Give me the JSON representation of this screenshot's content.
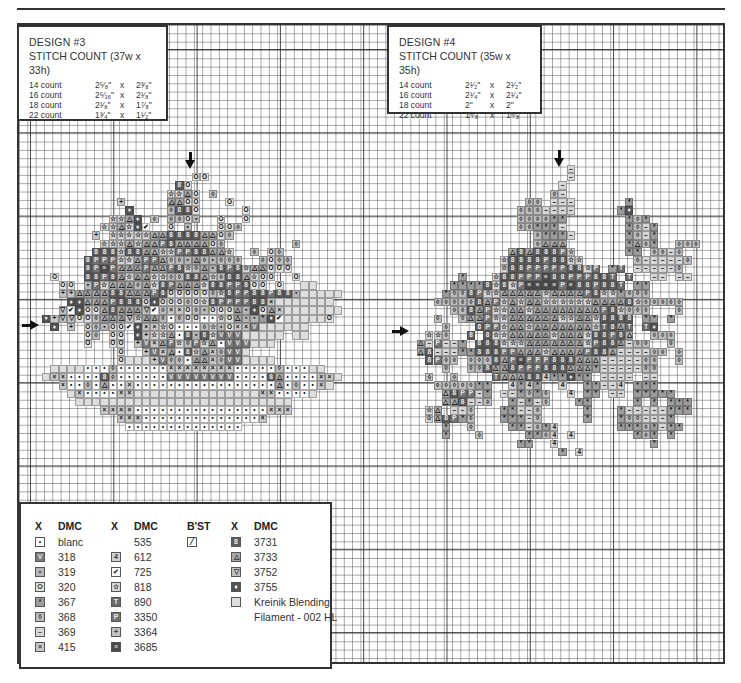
{
  "design3": {
    "title": "DESIGN #3",
    "stitch_count": "STITCH COUNT (37w x 33h)",
    "sizes": [
      {
        "count": "14 count",
        "w": "2⁵⁄₈\"",
        "x": "x",
        "h": "2³⁄₈\""
      },
      {
        "count": "16 count",
        "w": "2⁵⁄₁₆\"",
        "x": "x",
        "h": "2¹⁄₈\""
      },
      {
        "count": "18 count",
        "w": "2¹⁄₈\"",
        "x": "x",
        "h": "1⁷⁄₈\""
      },
      {
        "count": "22 count",
        "w": "1³⁄₄\"",
        "x": "x",
        "h": "1¹⁄₂\""
      }
    ]
  },
  "design4": {
    "title": "DESIGN #4",
    "stitch_count": "STITCH COUNT (35w x 35h)",
    "sizes": [
      {
        "count": "14 count",
        "w": "2¹⁄₂\"",
        "x": "x",
        "h": "2¹⁄₂\""
      },
      {
        "count": "16 count",
        "w": "2¹⁄₄\"",
        "x": "x",
        "h": "2¹⁄₄\""
      },
      {
        "count": "18 count",
        "w": "2\"",
        "x": "x",
        "h": "2\""
      },
      {
        "count": "22 count",
        "w": "1⁵⁄₈\"",
        "x": "x",
        "h": "1⁵⁄₈\""
      }
    ]
  },
  "legend": {
    "columns": [
      {
        "headers": {
          "x": "X",
          "dmc": "DMC"
        },
        "rows": [
          {
            "key": "w",
            "symbol": "•",
            "fill": "#ffffff",
            "dmc": "blanc"
          },
          {
            "key": "V",
            "symbol": "V",
            "fill": "#7a7a7a",
            "dmc": "318"
          },
          {
            "key": "o",
            "symbol": "▪",
            "fill": "#b5b5b5",
            "dmc": "319"
          },
          {
            "key": "O",
            "symbol": "O",
            "fill": "#e2e2e2",
            "dmc": "320"
          },
          {
            "key": "*",
            "symbol": "*",
            "fill": "#9c9c9c",
            "dmc": "367"
          },
          {
            "key": "d",
            "symbol": "◊",
            "fill": "#bdbdbd",
            "dmc": "368"
          },
          {
            "key": "-",
            "symbol": "–",
            "fill": "#d6d6d6",
            "dmc": "369"
          },
          {
            "key": "x",
            "symbol": "×",
            "fill": "#c8c8c8",
            "dmc": "415"
          }
        ]
      },
      {
        "headers": {
          "x": "X",
          "dmc": "DMC"
        },
        "rows": [
          {
            "key": "",
            "symbol": "",
            "fill": "",
            "dmc": "535"
          },
          {
            "key": "4",
            "symbol": "4",
            "fill": "#d0d0d0",
            "dmc": "612"
          },
          {
            "key": "v",
            "symbol": "✔",
            "fill": "#ffffff",
            "dmc": "725"
          },
          {
            "key": "s",
            "symbol": "☆",
            "fill": "#d8d8d8",
            "dmc": "818"
          },
          {
            "key": "T",
            "symbol": "T",
            "fill": "#6a6a6a",
            "dmc": "890"
          },
          {
            "key": "P",
            "symbol": "P",
            "fill": "#747474",
            "dmc": "3350"
          },
          {
            "key": "+",
            "symbol": "+",
            "fill": "#c4c4c4",
            "dmc": "3364"
          },
          {
            "key": "S",
            "symbol": "≡",
            "fill": "#4a4a4a",
            "dmc": "3685"
          }
        ]
      },
      {
        "headers": {
          "x": "B'ST"
        },
        "rows": [
          {
            "symbol": "⁄",
            "dmc": ""
          }
        ]
      },
      {
        "headers": {
          "x": "X",
          "dmc": "DMC"
        },
        "rows": [
          {
            "key": "B",
            "symbol": "8",
            "fill": "#5c5c5c",
            "dmc": "3731"
          },
          {
            "key": "A",
            "symbol": "△",
            "fill": "#a9a9a9",
            "dmc": "3733"
          },
          {
            "key": "t",
            "symbol": "▽",
            "fill": "#c2c2c2",
            "dmc": "3752"
          },
          {
            "key": "D",
            "symbol": "♦",
            "fill": "#525252",
            "dmc": "3755"
          },
          {
            "key": "k",
            "symbol": "",
            "fill": "#dedede",
            "dmc": "Kreinik Blending"
          },
          {
            "key": "",
            "symbol": "",
            "fill": "",
            "dmc": "Filament - 002 HL"
          }
        ]
      }
    ]
  },
  "pattern3": {
    "col0": 2,
    "row0": 18,
    "rows": [
      "...................OO",
      ".................BO..",
      "................ssAO.d",
      "..........+.....AAOO...O",
      "...........D....dBBO.....O",
      ".........ssAD.d.ddOo..O..O",
      "........ssAsDv..O.o...OOd",
      ".......+.sssssAABBBBAAOd",
      "........sssAsAAPBAAAAOd........d",
      ".......BBBsBBAAssPPBBAAs..d.Od",
      "......BPPPssAPPAddoAdoddd..dOdd",
      "......BPSPAAAPAAPBsdAoBPBsAAOOO",
      "..O...BBPBAsAAssddBBAsdBBAsOO..O",
      "...OO.oPsAAAdAsBPAAAsBBPPBOO.O..kk",
      "...++AAAABBAAAPBOOOOOdsBPPBBPBBokkkkk",
      "....DDAAAPBBBODOOOdOsBPPPPBBxkkkkkkk",
      "...tvDOOABAAAtvdxxOdoOOOAoDOAxkkkkkkk",
      ".D+ttOOdAAAtsAAdwdOOwwsOAoo*DvkkkkkO",
      "..D.+.OdoOOvDxxsOwwwdsoOxxVkkkkkk",
      "......Od.OO.D+ssAwBoBsVVVkkkkk.kk",
      "......O..OO.+VxAPsdPsAwVVVkkk",
      "..........O..+VxAwBsAxdVVk",
      "..........Okkk+VddwAAxdVVkkkk",
      "..kkkkwwwdwwwwwwxxxxxxxxwwwwwdwwwkk",
      ".kxxwwwwBdwwwwwwVVVVVVVVwwwwBAwwwwxxk",
      "...xwwdwAwwxwwwwwwwwwwwwwwwwwAwdwwxk",
      "....kxwwwwxxkkkkkkkkkkkkkkkxxwwwwk",
      ".....kkkkkkkkkkkkkkkkkkkkkkkkkk",
      "........xxxxwwwwwwwwwwwwwwwwxxx",
      "..........xxxwwwwwwwwwwwwwwx",
      "...........wwwwwwwwwwwwww"
    ]
  },
  "pattern4": {
    "col0": 48,
    "row0": 17,
    "rows": [
      "..................-",
      "..................-",
      ".................-",
      "................d-",
      ".............dd.---......*",
      "............ddd----.....*D",
      "............dddd**.......*d*",
      "............dd***-.......*d-*",
      "..............d***-......*d-*",
      "..............dAAA.......*Ad*..ddd",
      "...........ABABBBPs......**.dd-d",
      "..........sBBBBPBBss......d-----d",
      "..........sBBPPPPPBBsP.*T.-----d",
      ".....*...sBBPPPSBBPPPBBT.T..--.--",
      "....****BsBsPSSSSPSBBPBBT.**",
      "...*ddBPssAAAAAsAAAAPBss*ddd",
      "..dddddBAPsAsAAssssssAAAABsddddd",
      "....ddBAPssAAsAAAAAAAAPBsddd...d",
      "..d..dAAPssAAAAAAssAAsBBBB.**.*",
      "...d...BPPsAAsAAAAAAAsTBAT.TD",
      ".ssd..B.BssAAAAAsAAAsBBPBA..ddd",
      "A-P--*.BBBsssAAAAAAAsPBBA-dd..d",
      "AB---**BBBPPAAAsAAAAPBBA----dd.d",
      ".BPdd.dddBAPSPPPBBBAAA-----dd..d",
      "...d..ddBAABPPPBBBAAA*-----dd",
      ".d..d....TAAABB4**D**.----.--",
      "..ddddd**..4*4*..4..**--4.***",
      "...ABPP-*.--*d*d..4.**.--.*****",
      "...AAB--d..*-*-d...**.....*.*.***",
      ".sA8--d...**--d.....*...*-----***",
      ".sABP*d...***-d.....*...*dd---*",
      "...*..d....**-d*4.......***d*-**",
      "...*...d.....**d4.4.......*d*.*",
      "............**..4...........*",
      ".................*.4"
    ]
  },
  "arrows": {
    "d3_top": {
      "x": 190,
      "y": 170
    },
    "d3_left": {
      "x": 30,
      "y": 325
    },
    "d4_top": {
      "x": 559,
      "y": 162
    },
    "d4_left": {
      "x": 402,
      "y": 330
    }
  }
}
